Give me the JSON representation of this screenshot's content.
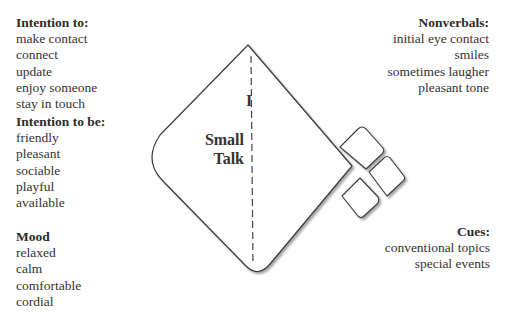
{
  "left_column": {
    "intention_to": {
      "heading": "Intention to:",
      "items": [
        "make contact",
        "connect",
        "update",
        "enjoy someone",
        "stay in touch"
      ]
    },
    "intention_to_be": {
      "heading": "Intention to be:",
      "items": [
        "friendly",
        "pleasant",
        "sociable",
        "playful",
        "available"
      ]
    },
    "mood": {
      "heading": "Mood",
      "items": [
        "relaxed",
        "calm",
        "comfortable",
        "cordial"
      ]
    }
  },
  "right_column": {
    "nonverbals": {
      "heading": "Nonverbals:",
      "items": [
        "initial eye contact",
        "smiles",
        "sometimes laugher",
        "pleasant tone"
      ]
    },
    "cues": {
      "heading": "Cues:",
      "items": [
        "conventional topics",
        "special events"
      ]
    }
  },
  "kite": {
    "roman_numeral": "I",
    "title_line1": "Small",
    "title_line2": "Talk",
    "stroke_color": "#3a3a3a",
    "shadow_color": "#bdbdbd"
  }
}
